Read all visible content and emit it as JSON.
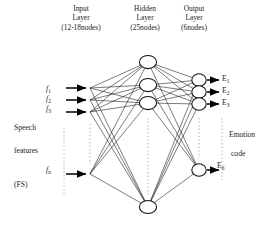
{
  "diagram": {
    "headers": [
      {
        "name": "input-layer-header",
        "line1": "Input",
        "line2": "Layer",
        "line3": "(12-18nodes)"
      },
      {
        "name": "hidden-layer-header",
        "line1": "Hidden",
        "line2": "Layer",
        "line3": "(25nodes)"
      },
      {
        "name": "output-layer-header",
        "line1": "Output",
        "line2": "Layer",
        "line3": "(6nodes)"
      }
    ],
    "input_labels": [
      {
        "base": "f",
        "sub": "1"
      },
      {
        "base": "f",
        "sub": "2"
      },
      {
        "base": "f",
        "sub": "3"
      },
      {
        "base": "f",
        "sub": "n"
      }
    ],
    "input_group_label": {
      "line1": "Speech",
      "line2": "features",
      "line3": "(FS)"
    },
    "output_labels": [
      {
        "base": "E",
        "sub": "1"
      },
      {
        "base": "E",
        "sub": "2"
      },
      {
        "base": "E",
        "sub": "3"
      },
      {
        "base": "E",
        "sub": "6"
      }
    ],
    "output_group_label": {
      "line1": "Emotion",
      "line2": "code"
    },
    "colors": {
      "stroke": "#111111",
      "node_fill": "#ffffff",
      "background": "#ffffff",
      "dotted": "#8d8d8d"
    },
    "layers": {
      "input": {
        "visible_nodes": 4,
        "declared_count": "12-18nodes",
        "has_ellipsis": true
      },
      "hidden": {
        "visible_nodes": 4,
        "declared_count": "25nodes",
        "has_ellipsis": true
      },
      "output": {
        "visible_nodes": 4,
        "declared_count": "6nodes",
        "has_ellipsis": true
      }
    }
  }
}
